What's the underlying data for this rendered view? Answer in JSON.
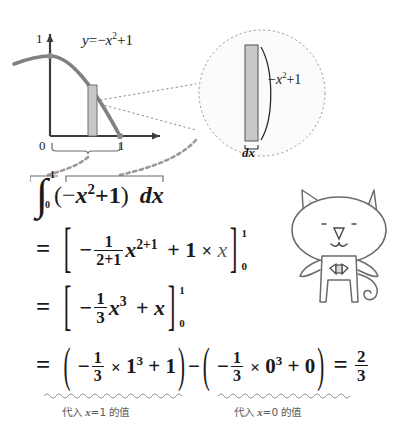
{
  "figure": {
    "axis_labels": {
      "origin": "0",
      "y_one": "1",
      "x_one": "1"
    },
    "curve_label_parts": {
      "y": "y",
      "eq": "=",
      "neg": "−",
      "x": "x",
      "exp": "2",
      "plus1": "+1"
    },
    "curve_label": "y = −x² + 1",
    "strip_fill": "#c8c8c8",
    "strip_stroke": "#6f6f6f",
    "curve_color": "#808080",
    "axis_color": "#3c3c3c",
    "magnifier": {
      "height_label": "−x²+1",
      "height_label_parts": {
        "neg": "−",
        "x": "x",
        "exp": "2",
        "plus1": "+1"
      },
      "width_label": "dx",
      "circle_stroke": "#9a9a9a",
      "fill": "#fbfbfb"
    }
  },
  "equations": {
    "line1": {
      "integral_symbol": "∫",
      "upper_limit": "1",
      "lower_limit": "0",
      "open_paren": "(",
      "neg": "−",
      "var": "x",
      "exponent": "2",
      "plus_one": "+1",
      "close_paren": ")",
      "differential": "dx"
    },
    "line2": {
      "equals": "=",
      "open_bracket": "[",
      "minus": "−",
      "frac_num": "1",
      "frac_den": "2+1",
      "var": "x",
      "exponent": "2+1",
      "plus": "+",
      "coefficient": "1",
      "times": "×",
      "var2": "x",
      "close_bracket": "]",
      "limit_upper": "1",
      "limit_lower": "0"
    },
    "line3": {
      "equals": "=",
      "open_bracket": "[",
      "minus": "−",
      "frac_num": "1",
      "frac_den": "3",
      "var": "x",
      "exponent": "3",
      "plus": "+",
      "var2": "x",
      "close_bracket": "]",
      "limit_upper": "1",
      "limit_lower": "0"
    },
    "line4": {
      "equals": "=",
      "open_paren": "(",
      "minus": "−",
      "frac_num": "1",
      "frac_den": "3",
      "times": "×",
      "base": "1",
      "exponent": "3",
      "plus": "+",
      "addend": "1",
      "close_paren": ")",
      "subtract": "−",
      "open_paren2": "(",
      "minus2": "−",
      "frac_num2": "1",
      "frac_den2": "3",
      "times2": "×",
      "base2": "0",
      "exponent2": "3",
      "plus2": "+",
      "addend2": "0",
      "close_paren2": ")",
      "equals2": "=",
      "result_num": "2",
      "result_den": "3"
    }
  },
  "annotations": {
    "left": {
      "prefix": "代入",
      "var": "x",
      "eq": "=",
      "value": "1",
      "suffix": "的值",
      "full": "代入 x=1 的值"
    },
    "right": {
      "prefix": "代入",
      "var": "x",
      "eq": "=",
      "value": "0",
      "suffix": "的值",
      "full": "代入 x=0 的值"
    }
  },
  "mascot": {
    "name": "cat-character",
    "outline_color": "#6b6b6b",
    "body_fill": "#ffffff",
    "ear_fill": "#e8e8e8"
  }
}
